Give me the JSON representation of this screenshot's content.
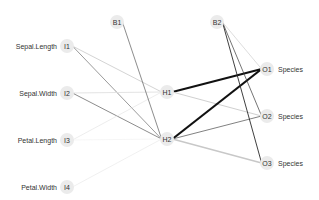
{
  "diagram": {
    "type": "neural-network",
    "nodes": [
      {
        "id": "B1",
        "label": "B1",
        "x": 117,
        "y": 22,
        "layer": "bias1"
      },
      {
        "id": "B2",
        "label": "B2",
        "x": 217,
        "y": 22,
        "layer": "bias2"
      },
      {
        "id": "I1",
        "label": "I1",
        "x": 67,
        "y": 46,
        "layer": "input",
        "var": "Sepal.Length"
      },
      {
        "id": "I2",
        "label": "I2",
        "x": 67,
        "y": 93,
        "layer": "input",
        "var": "Sepal.Width"
      },
      {
        "id": "I3",
        "label": "I3",
        "x": 67,
        "y": 140,
        "layer": "input",
        "var": "Petal.Length"
      },
      {
        "id": "I4",
        "label": "I4",
        "x": 67,
        "y": 187,
        "layer": "input",
        "var": "Petal.Width"
      },
      {
        "id": "H1",
        "label": "H1",
        "x": 167,
        "y": 92,
        "layer": "hidden"
      },
      {
        "id": "H2",
        "label": "H2",
        "x": 167,
        "y": 139,
        "layer": "hidden"
      },
      {
        "id": "O1",
        "label": "O1",
        "x": 267,
        "y": 69,
        "layer": "output",
        "var": "Species"
      },
      {
        "id": "O2",
        "label": "O2",
        "x": 267,
        "y": 116,
        "layer": "output",
        "var": "Species"
      },
      {
        "id": "O3",
        "label": "O3",
        "x": 267,
        "y": 163,
        "layer": "output",
        "var": "Species"
      }
    ],
    "edges": [
      {
        "from": "I1",
        "to": "H1",
        "color": "#d4d4d4",
        "width": 1.0
      },
      {
        "from": "I1",
        "to": "H2",
        "color": "#6e6e6e",
        "width": 0.7
      },
      {
        "from": "I2",
        "to": "H1",
        "color": "#dcdcdc",
        "width": 0.8
      },
      {
        "from": "I2",
        "to": "H2",
        "color": "#5a5a5a",
        "width": 0.7
      },
      {
        "from": "I3",
        "to": "H1",
        "color": "#e8e8e8",
        "width": 0.8
      },
      {
        "from": "I3",
        "to": "H2",
        "color": "#f0f0f0",
        "width": 0.6
      },
      {
        "from": "I4",
        "to": "H2",
        "color": "#ececec",
        "width": 0.8
      },
      {
        "from": "B1",
        "to": "H2",
        "color": "#5a5a5a",
        "width": 0.7
      },
      {
        "from": "H1",
        "to": "O1",
        "color": "#111111",
        "width": 2.0
      },
      {
        "from": "H1",
        "to": "O2",
        "color": "#d0d0d0",
        "width": 1.0
      },
      {
        "from": "H2",
        "to": "O1",
        "color": "#111111",
        "width": 2.2
      },
      {
        "from": "H2",
        "to": "O2",
        "color": "#4a4a4a",
        "width": 0.7
      },
      {
        "from": "H2",
        "to": "O3",
        "color": "#c8c8c8",
        "width": 1.4
      },
      {
        "from": "B2",
        "to": "O1",
        "color": "#d4d4d4",
        "width": 0.8
      },
      {
        "from": "B2",
        "to": "O2",
        "color": "#3a3a3a",
        "width": 0.7
      },
      {
        "from": "B2",
        "to": "O3",
        "color": "#2a2a2a",
        "width": 0.9
      }
    ]
  },
  "labels": {
    "inputs": [
      "Sepal.Length",
      "Sepal.Width",
      "Petal.Length",
      "Petal.Width"
    ],
    "outputs": [
      "Species",
      "Species",
      "Species"
    ]
  }
}
